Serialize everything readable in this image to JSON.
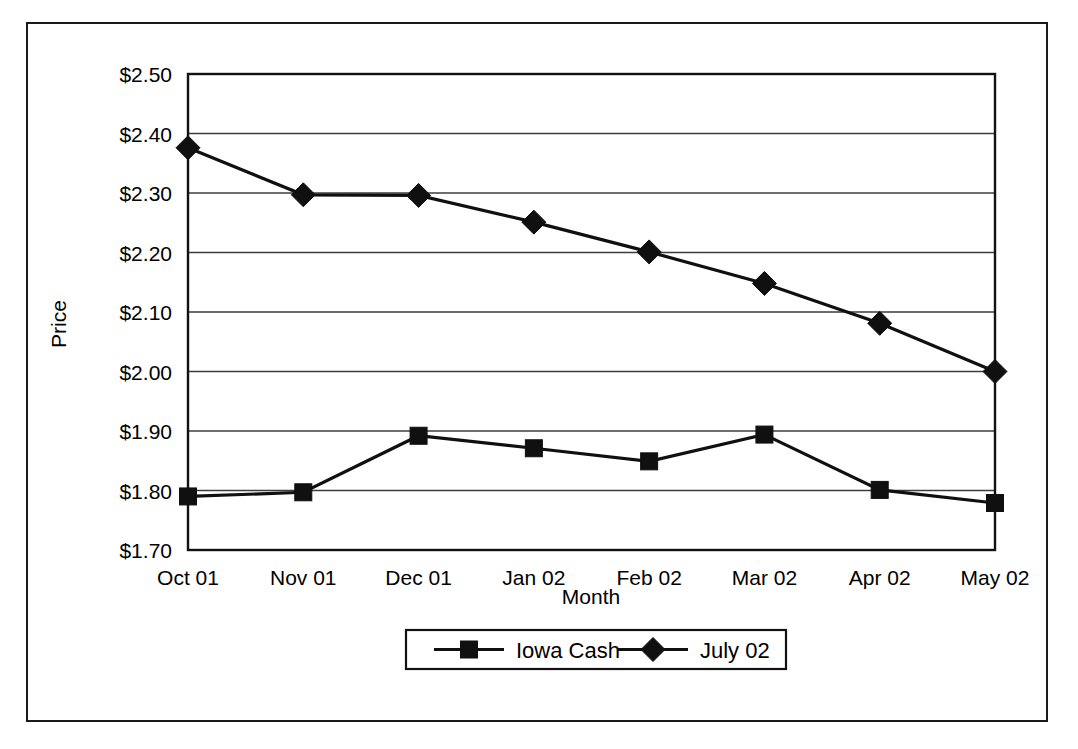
{
  "chart_data": {
    "type": "line",
    "title": "",
    "xlabel": "Month",
    "ylabel": "Price",
    "categories": [
      "Oct 01",
      "Nov 01",
      "Dec 01",
      "Jan 02",
      "Feb 02",
      "Mar 02",
      "Apr 02",
      "May 02"
    ],
    "ylim": [
      1.7,
      2.5
    ],
    "ytick_step": 0.1,
    "ytick_labels": [
      "$2.50",
      "$2.40",
      "$2.30",
      "$2.20",
      "$2.10",
      "$2.00",
      "$1.90",
      "$1.80",
      "$1.70"
    ],
    "ytick_values": [
      2.5,
      2.4,
      2.3,
      2.2,
      2.1,
      2.0,
      1.9,
      1.8,
      1.7
    ],
    "grid": true,
    "legend_position": "bottom",
    "series": [
      {
        "name": "Iowa Cash",
        "marker": "square",
        "color": "#101010",
        "values": [
          1.79,
          1.797,
          1.892,
          1.871,
          1.849,
          1.894,
          1.801,
          1.779
        ]
      },
      {
        "name": "July 02",
        "marker": "diamond",
        "color": "#101010",
        "values": [
          2.376,
          2.297,
          2.296,
          2.251,
          2.201,
          2.148,
          2.081,
          2.0
        ]
      }
    ]
  },
  "legend": {
    "entries": [
      {
        "label": "Iowa Cash",
        "marker": "square-marker"
      },
      {
        "label": "July 02",
        "marker": "diamond-marker"
      }
    ]
  },
  "axes": {
    "y_axis_title": "Price",
    "x_axis_title": "Month"
  }
}
